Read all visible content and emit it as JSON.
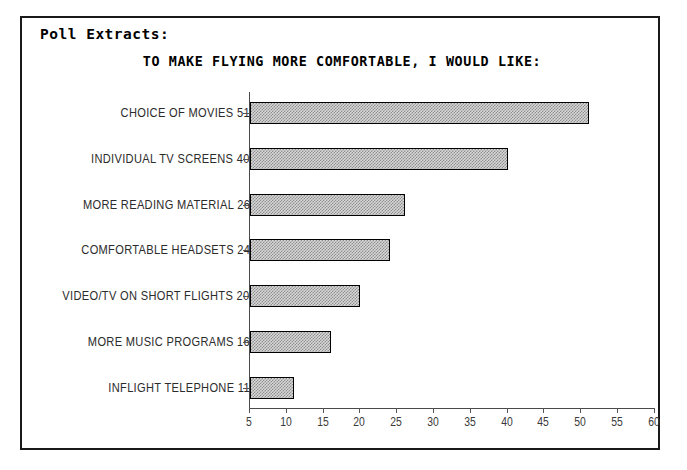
{
  "header": {
    "section_label": "Poll Extracts:"
  },
  "chart_data": {
    "type": "bar",
    "orientation": "horizontal",
    "title": "TO MAKE FLYING MORE COMFORTABLE, I WOULD LIKE:",
    "xlabel": "",
    "ylabel": "",
    "xlim": [
      5,
      60
    ],
    "xticks": [
      5,
      10,
      15,
      20,
      25,
      30,
      35,
      40,
      45,
      50,
      55,
      60
    ],
    "grid": false,
    "legend": null,
    "bar_fill": "#d8d8d8",
    "bar_hatch": "dither-checker",
    "bar_edge_color": "#000000",
    "categories": [
      "CHOICE OF MOVIES",
      "INDIVIDUAL TV SCREENS",
      "MORE READING MATERIAL",
      "COMFORTABLE HEADSETS",
      "VIDEO/TV ON SHORT FLIGHTS",
      "MORE MUSIC PROGRAMS",
      "INFLIGHT TELEPHONE"
    ],
    "values": [
      51,
      40,
      26,
      24,
      20,
      16,
      11
    ],
    "value_suffix": "%",
    "labels": [
      "CHOICE OF MOVIES 51%",
      "INDIVIDUAL TV SCREENS 40%",
      "MORE READING MATERIAL 26%",
      "COMFORTABLE HEADSETS 24%",
      "VIDEO/TV ON SHORT FLIGHTS 20%",
      "MORE MUSIC PROGRAMS 16%",
      "INFLIGHT TELEPHONE 11%"
    ]
  }
}
